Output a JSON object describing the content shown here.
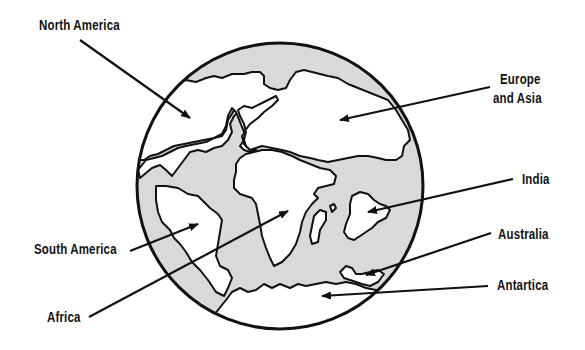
{
  "diagram": {
    "colors": {
      "ocean": "#d9d9d9",
      "land": "#ffffff",
      "outline": "#111111",
      "background": "#ffffff"
    },
    "labels": {
      "north_america": "North America",
      "europe_asia_line1": "Europe",
      "europe_asia_line2": "and Asia",
      "india": "India",
      "south_america": "South America",
      "australia": "Australia",
      "africa": "Africa",
      "antarctica": "Antartica"
    }
  }
}
